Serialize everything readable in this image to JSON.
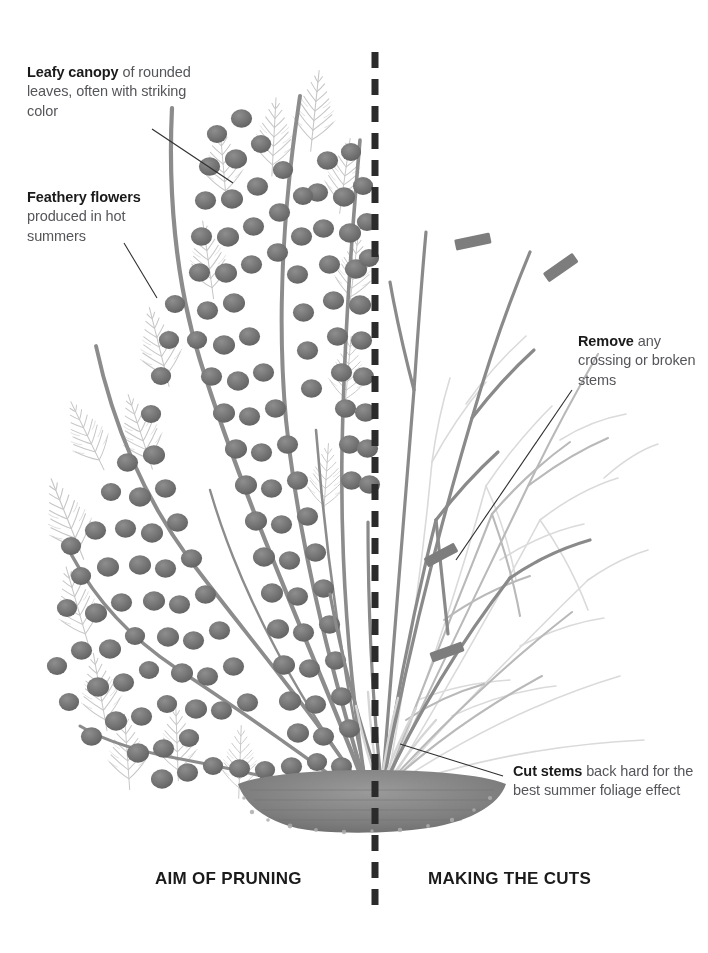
{
  "figure": {
    "kind": "pruning-diagram",
    "background_color": "#ffffff"
  },
  "divider": {
    "name": "vertical-dashed-divider",
    "style": "dashed",
    "color": "#2b2b2b",
    "x": 375,
    "y_top": 52,
    "y_bottom": 905,
    "dash_length": 16,
    "gap_length": 11,
    "thickness": 7
  },
  "panels": {
    "left": {
      "caption": "AIM OF PRUNING",
      "content": "fully leafed shrub with rounded foliage and feathery flower plumes"
    },
    "right": {
      "caption": "MAKING THE CUTS",
      "content": "bare stem framework with cut position markers"
    }
  },
  "callouts": [
    {
      "id": "leafy-canopy",
      "lead": "Leafy canopy",
      "rest": " of rounded leaves, often with striking color",
      "position": {
        "x": 27,
        "y": 63
      },
      "leader": {
        "from": [
          152,
          129
        ],
        "to": [
          233,
          183
        ]
      }
    },
    {
      "id": "feathery-flowers",
      "lead": "Feathery flowers",
      "rest": " produced in hot summers",
      "position": {
        "x": 27,
        "y": 188
      },
      "leader": {
        "from": [
          124,
          243
        ],
        "to": [
          156,
          297
        ]
      }
    },
    {
      "id": "remove-stems",
      "lead": "Remove",
      "rest": " any crossing or broken stems",
      "position": {
        "x": 578,
        "y": 332
      },
      "leader": {
        "from": [
          572,
          390
        ],
        "to": [
          456,
          560
        ]
      }
    },
    {
      "id": "cut-stems",
      "lead": "Cut stems",
      "rest": " back hard for the best summer foliage effect",
      "position": {
        "x": 513,
        "y": 762
      },
      "leader": {
        "from": [
          503,
          776
        ],
        "to": [
          400,
          744
        ]
      }
    }
  ],
  "colors": {
    "leaf_dark": "#6d6d6d",
    "leaf_mid": "#8a8a8a",
    "plume_light": "#c9c9c9",
    "stem_dark": "#7a7a7a",
    "stem_light": "#cfcfcf",
    "cut_marker": "#7d7d7d",
    "mulch": "#858585",
    "text_heading": "#1a1a1a",
    "text_body": "#55565a",
    "leader_line": "#2f2f2f",
    "divider": "#2b2b2b"
  },
  "cut_markers": [
    {
      "x": 473,
      "y": 243,
      "angle": -12
    },
    {
      "x": 561,
      "y": 268,
      "angle": -35
    },
    {
      "x": 441,
      "y": 556,
      "angle": -28
    },
    {
      "x": 446,
      "y": 652,
      "angle": -20
    }
  ],
  "mulch": {
    "name": "mulch-mound",
    "center_x": 372,
    "center_y": 800,
    "width": 270,
    "height": 55
  }
}
